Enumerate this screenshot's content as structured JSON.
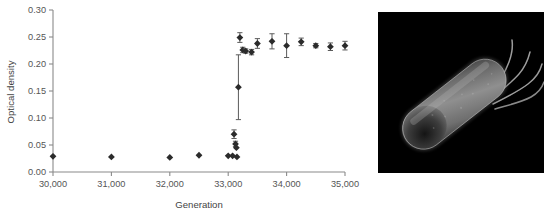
{
  "figure": {
    "panels": [
      "optical-density-chart",
      "bacterium-micrograph"
    ]
  },
  "micrograph": {
    "subject_label": "rod-shaped bacterium with flagella",
    "background_color": "#000000",
    "cell_color": "#8d8d8d",
    "flagella_color": "#9a9a9a"
  },
  "chart_data": {
    "type": "scatter",
    "title": "",
    "xlabel": "Generation",
    "ylabel": "Optical density",
    "xlim": [
      30000,
      35000
    ],
    "ylim": [
      0.0,
      0.3
    ],
    "grid": false,
    "legend": null,
    "xticks": [
      30000,
      31000,
      32000,
      33000,
      34000,
      35000
    ],
    "xticklabels": [
      "30,000",
      "31,000",
      "32,000",
      "33,000",
      "34,000",
      "35,000"
    ],
    "yticks": [
      0.0,
      0.05,
      0.1,
      0.15,
      0.2,
      0.25,
      0.3
    ],
    "yticklabels": [
      "0.00",
      "0.05",
      "0.10",
      "0.15",
      "0.20",
      "0.25",
      "0.30"
    ],
    "marker": "diamond",
    "marker_color": "#2b2b2b",
    "errorbar_color": "#5b5b5b",
    "x": [
      30000,
      31000,
      32000,
      32500,
      33000,
      33075,
      33100,
      33125,
      33140,
      33150,
      33175,
      33200,
      33250,
      33300,
      33400,
      33500,
      33750,
      34000,
      34250,
      34500,
      34750,
      35000
    ],
    "y": [
      0.029,
      0.028,
      0.027,
      0.031,
      0.03,
      0.03,
      0.07,
      0.052,
      0.045,
      0.028,
      0.157,
      0.249,
      0.226,
      0.224,
      0.222,
      0.238,
      0.242,
      0.234,
      0.241,
      0.234,
      0.232,
      0.234
    ],
    "yerr": [
      0.0,
      0.0,
      0.0,
      0.0,
      0.0,
      0.0,
      0.008,
      0.005,
      0.0,
      0.0,
      0.06,
      0.009,
      0.005,
      0.004,
      0.005,
      0.009,
      0.014,
      0.022,
      0.007,
      0.004,
      0.007,
      0.008
    ]
  }
}
